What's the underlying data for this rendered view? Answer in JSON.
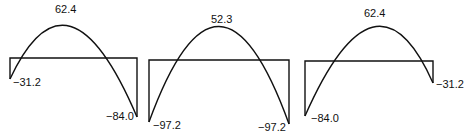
{
  "diagram": {
    "type": "bending-moment-diagram",
    "panels": [
      {
        "id": "span-1",
        "peak_label": "62.4",
        "left_label": "−31.2",
        "right_label": "−84.0"
      },
      {
        "id": "span-2",
        "peak_label": "52.3",
        "left_label": "−97.2",
        "right_label": "−97.2"
      },
      {
        "id": "span-3",
        "peak_label": "62.4",
        "left_label": "−84.0",
        "right_label": "−31.2"
      }
    ]
  }
}
